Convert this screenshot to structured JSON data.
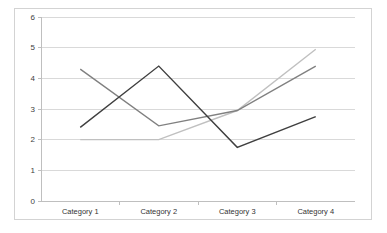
{
  "chart_data": {
    "type": "line",
    "title": "",
    "subtitle": "",
    "xlabel": "",
    "ylabel": "",
    "categories": [
      "Category 1",
      "Category 2",
      "Category 3",
      "Category 4"
    ],
    "series": [
      {
        "name": "Series 1",
        "color": "#3f3f3f",
        "values": [
          2.4,
          4.4,
          1.75,
          2.75
        ]
      },
      {
        "name": "Series 2",
        "color": "#808080",
        "values": [
          4.3,
          2.45,
          2.95,
          4.4
        ]
      },
      {
        "name": "Series 3",
        "color": "#c0c0c0",
        "values": [
          2.0,
          2.0,
          2.95,
          4.95
        ]
      }
    ],
    "ylim": [
      0,
      6
    ],
    "ytick_values": [
      0,
      1,
      2,
      3,
      4,
      5,
      6
    ],
    "ytick_labels": [
      "0",
      "1",
      "2",
      "3",
      "4",
      "5",
      "6"
    ],
    "grid": true,
    "grid_axis": "y",
    "legend": false,
    "legend_position": "none",
    "plot_background": "#ffffff",
    "grid_color": "#d9d9d9",
    "axis_color": "#bfbfbf",
    "border_color": "#d3d3d3"
  }
}
